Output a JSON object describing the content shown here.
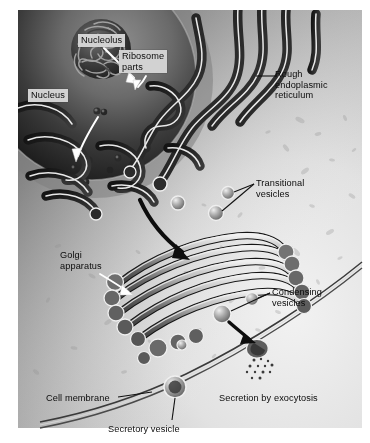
{
  "figure": {
    "kind": "biology-diagram",
    "width": 370,
    "height": 443,
    "background_color": "#ffffff"
  },
  "palette": {
    "paper": "#ffffff",
    "cytoplasm_light": "#e9e9e9",
    "cytoplasm_mid": "#b9b9b9",
    "nucleus_dark": "#1d1d1d",
    "nucleus_rim": "#9a9a9a",
    "membrane_outline": "#f2f2f2",
    "lumen_dark": "#2a2a2a",
    "golgi_grey": "#8e8e8e",
    "label_box": "#d2d2d2",
    "label_text": "#0b0b0b",
    "leader_line": "#151515",
    "white_arrow": "#ffffff"
  },
  "labels": [
    {
      "id": "nucleolus",
      "text": "Nucleolus",
      "style": "boxed",
      "x": 78,
      "y": 34,
      "leader": "white-arrow-down-right"
    },
    {
      "id": "ribosome_parts",
      "text": "Ribosome\nparts",
      "style": "boxed",
      "x": 119,
      "y": 50,
      "leader": "white-arrow-down-left"
    },
    {
      "id": "nucleus",
      "text": "Nucleus",
      "style": "boxed",
      "x": 28,
      "y": 89,
      "leader": "white-arrow-down-right"
    },
    {
      "id": "rough_er",
      "text": "Rough\nendoplasmic\nreticulum",
      "style": "plain",
      "x": 275,
      "y": 69,
      "leader": "black-line-left"
    },
    {
      "id": "transitional_vesicles",
      "text": "Transitional\nvesicles",
      "style": "plain",
      "x": 256,
      "y": 178,
      "leader": "black-vee-left"
    },
    {
      "id": "golgi_apparatus",
      "text": "Golgi\napparatus",
      "style": "plain",
      "x": 60,
      "y": 250,
      "leader": "white-arrow-down-right"
    },
    {
      "id": "condensing_vesicles",
      "text": "Condensing\nvesicles",
      "style": "plain",
      "x": 272,
      "y": 287,
      "leader": "black-line-left"
    },
    {
      "id": "cell_membrane",
      "text": "Cell membrane",
      "style": "plain",
      "x": 46,
      "y": 393,
      "leader": "black-line-right"
    },
    {
      "id": "secretory_vesicle",
      "text": "Secretory vesicle",
      "style": "plain",
      "x": 108,
      "y": 424,
      "leader": "black-line-up"
    },
    {
      "id": "secretion_by_exocytosis",
      "text": "Secretion by exocytosis",
      "style": "plain",
      "x": 219,
      "y": 393,
      "leader": "none"
    }
  ],
  "structures": [
    {
      "id": "nucleus",
      "name": "Nucleus",
      "description": "Large dark sphere occupying the upper-left quadrant, bounded by a nuclear envelope."
    },
    {
      "id": "nucleolus",
      "name": "Nucleolus",
      "description": "Tangled convoluted dense mass inside the nucleus."
    },
    {
      "id": "ribosome_parts",
      "name": "Ribosome parts",
      "description": "Small dark granules exiting the nucleus toward the rough ER."
    },
    {
      "id": "rough_er",
      "name": "Rough endoplasmic reticulum",
      "description": "Folded membrane cisternae with dark lumen and light outline, wrapping around the nucleus."
    },
    {
      "id": "transitional_vesicles",
      "name": "Transitional vesicles",
      "description": "Small round vesicles budding from the rough ER between ER and Golgi."
    },
    {
      "id": "golgi_apparatus",
      "name": "Golgi apparatus",
      "description": "Diagonal stack of five flattened curved cisternae with bulbous ends."
    },
    {
      "id": "condensing_vesicles",
      "name": "Condensing vesicles",
      "description": "Round vesicles budding from the trans face of the Golgi."
    },
    {
      "id": "secretory_vesicle",
      "name": "Secretory vesicle",
      "description": "Large round vesicle near the cell membrane at bottom left."
    },
    {
      "id": "cell_membrane",
      "name": "Cell membrane",
      "description": "Double-line boundary arcing across the lower-right of the figure."
    },
    {
      "id": "exocytosis",
      "name": "Secretion by exocytosis",
      "description": "Vesicle fused with the cell membrane releasing a spray of small particles outside the cell."
    }
  ],
  "secretion_particles": {
    "count": 13,
    "dots": [
      [
        254,
        360
      ],
      [
        261,
        359
      ],
      [
        268,
        361
      ],
      [
        250,
        366
      ],
      [
        258,
        366
      ],
      [
        265,
        366
      ],
      [
        272,
        365
      ],
      [
        247,
        372
      ],
      [
        255,
        372
      ],
      [
        263,
        372
      ],
      [
        270,
        372
      ],
      [
        252,
        378
      ],
      [
        260,
        378
      ]
    ]
  }
}
